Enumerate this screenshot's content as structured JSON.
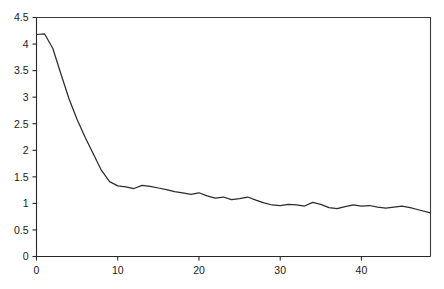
{
  "figure": {
    "background_color": "#ffffff",
    "line_color": "#2b2b2b",
    "axis_color": "#262626",
    "width": 444,
    "height": 289
  },
  "chart_data": {
    "type": "line",
    "title": "",
    "subtitle": "",
    "xlabel": "",
    "ylabel": "",
    "xlim": [
      0,
      48.5
    ],
    "ylim": [
      0,
      4.5
    ],
    "grid": false,
    "legend": null,
    "legend_position": "none",
    "xticks": [
      0,
      10,
      20,
      30,
      40
    ],
    "xtick_labels": [
      "0",
      "10",
      "20",
      "30",
      "40"
    ],
    "yticks": [
      0,
      0.5,
      1,
      1.5,
      2,
      2.5,
      3,
      3.5,
      4,
      4.5
    ],
    "ytick_labels": [
      "0",
      "0.5",
      "1",
      "1.5",
      "2",
      "2.5",
      "3",
      "3.5",
      "4",
      "4.5"
    ],
    "series": [
      {
        "name": "curve",
        "color": "#2b2b2b",
        "x": [
          0,
          1,
          2,
          3,
          4,
          5,
          6,
          7,
          8,
          9,
          10,
          11,
          12,
          13,
          14,
          15,
          16,
          17,
          18,
          19,
          20,
          21,
          22,
          23,
          24,
          25,
          26,
          27,
          28,
          29,
          30,
          31,
          32,
          33,
          34,
          35,
          36,
          37,
          38,
          39,
          40,
          41,
          42,
          43,
          44,
          45,
          46,
          47,
          48.5
        ],
        "values": [
          4.18,
          4.19,
          3.92,
          3.44,
          2.97,
          2.58,
          2.24,
          1.93,
          1.62,
          1.41,
          1.33,
          1.31,
          1.28,
          1.34,
          1.32,
          1.29,
          1.26,
          1.22,
          1.2,
          1.17,
          1.2,
          1.14,
          1.1,
          1.12,
          1.07,
          1.09,
          1.12,
          1.06,
          1.01,
          0.97,
          0.96,
          0.98,
          0.97,
          0.95,
          1.02,
          0.98,
          0.92,
          0.9,
          0.94,
          0.97,
          0.95,
          0.96,
          0.93,
          0.91,
          0.93,
          0.95,
          0.92,
          0.88,
          0.82
        ]
      }
    ]
  }
}
